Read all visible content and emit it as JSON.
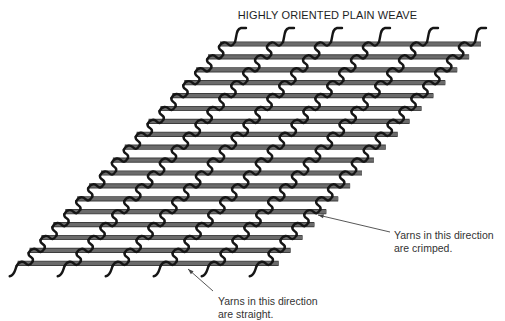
{
  "title": "HIGHLY ORIENTED PLAIN WEAVE",
  "annotations": [
    {
      "id": "crimped",
      "lines": [
        "Yarns in this direction",
        "are crimped."
      ],
      "text_pos": [
        394,
        229
      ],
      "arrow": {
        "from": [
          390,
          232
        ],
        "to": [
          318,
          215
        ]
      }
    },
    {
      "id": "straight",
      "lines": [
        "Yarns in this direction",
        "are straight."
      ],
      "text_pos": [
        218,
        295
      ],
      "arrow": {
        "from": [
          213,
          291
        ],
        "to": [
          188,
          269
        ]
      }
    }
  ],
  "weave": {
    "straight_yarns": {
      "count": 18,
      "top_left": [
        220,
        44
      ],
      "top_right": [
        481,
        44
      ],
      "row_dy": 12.9,
      "row_dx": -11.9,
      "thickness": 4,
      "color": "#6b6b6b",
      "edge_color": "#3d3d3d"
    },
    "crimped_yarns": {
      "count": 11,
      "spacing_x": 48,
      "first_top_x": 228,
      "thickness": 2.4,
      "color": "#161616"
    }
  },
  "colors": {
    "background": "#ffffff",
    "text": "#222222",
    "arrow": "#444444"
  }
}
